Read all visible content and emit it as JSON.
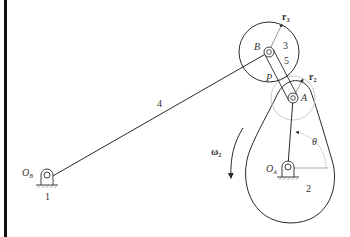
{
  "figure": {
    "type": "mechanism-diagram",
    "labels": {
      "link_4": "4",
      "ground_1": "1",
      "pivot_OB": "O",
      "pivot_OB_sub": "B",
      "pivot_OA": "O",
      "pivot_OA_sub": "A",
      "point_B": "B",
      "point_A": "A",
      "point_P": "P",
      "gear_3": "3",
      "link_5": "5",
      "body_2": "2",
      "radius_r3": "r",
      "radius_r3_sub": "3",
      "radius_r2": "r",
      "radius_r2_sub": "2",
      "omega": "ω",
      "omega_sub": "2",
      "angle": "θ"
    },
    "colors": {
      "line": "#2a2a2a",
      "thin_line": "#555555",
      "pitch_circle": "#bdbdbd",
      "border": "#111111",
      "background": "#ffffff"
    }
  }
}
